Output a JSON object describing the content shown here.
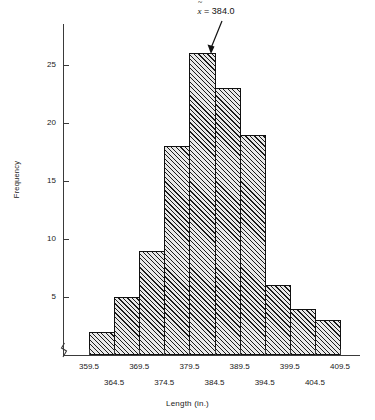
{
  "chart_data": {
    "type": "bar",
    "title": "",
    "xlabel": "Length (in.)",
    "ylabel": "Frequency",
    "bin_edges": [
      359.5,
      364.5,
      369.5,
      374.5,
      379.5,
      384.5,
      389.5,
      394.5,
      399.5,
      404.5,
      409.5
    ],
    "categories": [
      "359.5-364.5",
      "364.5-369.5",
      "369.5-374.5",
      "374.5-379.5",
      "379.5-384.5",
      "384.5-389.5",
      "389.5-394.5",
      "394.5-399.5",
      "399.5-404.5",
      "404.5-409.5"
    ],
    "values": [
      2,
      5,
      9,
      18,
      26,
      23,
      19,
      6,
      4,
      3
    ],
    "x_tick_labels": [
      "359.5",
      "364.5",
      "369.5",
      "374.5",
      "379.5",
      "384.5",
      "389.5",
      "394.5",
      "399.5",
      "404.5",
      "409.5"
    ],
    "y_tick_labels": [
      "5",
      "10",
      "15",
      "20",
      "25"
    ],
    "y_ticks": [
      5,
      10,
      15,
      20,
      25
    ],
    "ylim": [
      0,
      27.5
    ],
    "xlim": [
      359.5,
      409.5
    ],
    "grid": false,
    "legend": null,
    "annotations": [
      {
        "name": "median-marker",
        "symbol": "x̃",
        "equals": "=",
        "value": "384.0",
        "text": "x̃ = 384.0",
        "points_to_bin": "379.5-384.5"
      }
    ],
    "axis_break": true,
    "bar_fill": "#e8e8e8",
    "bar_hatch": "diagonal-45",
    "bar_edge_color": "#111111"
  }
}
